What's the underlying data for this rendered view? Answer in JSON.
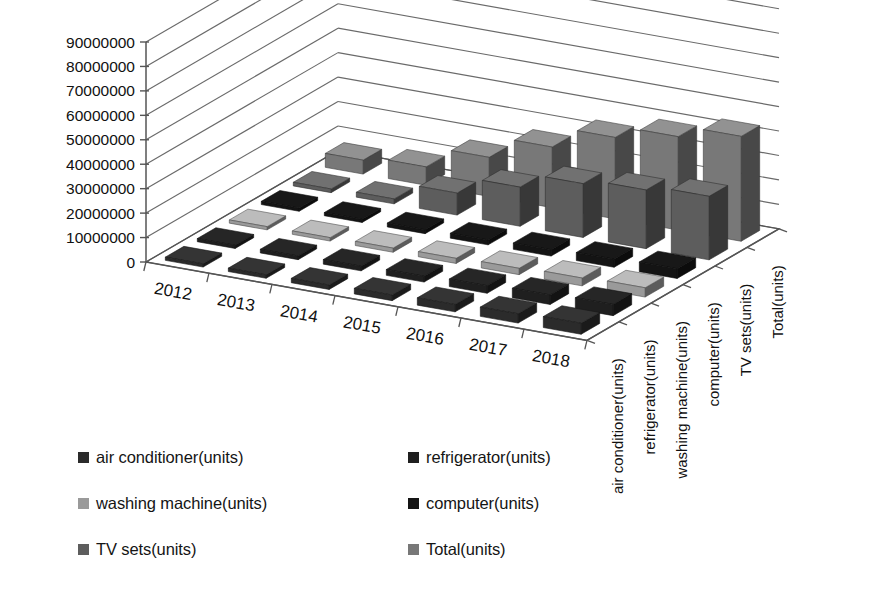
{
  "chart_data": {
    "type": "bar",
    "subtype": "3d-clustered-bar",
    "title": "",
    "xlabel": "",
    "ylabel": "",
    "zlabel": "",
    "grid": true,
    "legend_position": "bottom",
    "ylim": [
      0,
      90000000
    ],
    "yticks": [
      0,
      10000000,
      20000000,
      30000000,
      40000000,
      50000000,
      60000000,
      70000000,
      80000000,
      90000000
    ],
    "ytick_labels": [
      "0",
      "10000000",
      "20000000",
      "30000000",
      "40000000",
      "50000000",
      "60000000",
      "70000000",
      "80000000",
      "90000000"
    ],
    "categories": [
      "2012",
      "2013",
      "2014",
      "2015",
      "2016",
      "2017",
      "2018"
    ],
    "depth_axis_labels": [
      "air conditioner(units)",
      "refrigerator(units)",
      "washing machine(units)",
      "computer(units)",
      "TV sets(units)",
      "Total(units)"
    ],
    "series": [
      {
        "name": "air conditioner(units)",
        "color": "#2b2b2b",
        "values": [
          1000000,
          1400000,
          1800000,
          2300000,
          3000000,
          3800000,
          4500000
        ]
      },
      {
        "name": "refrigerator(units)",
        "color": "#1f1f1f",
        "values": [
          1200000,
          1500000,
          1900000,
          2400000,
          3100000,
          3900000,
          4600000
        ]
      },
      {
        "name": "washing machine(units)",
        "color": "#9a9a9a",
        "values": [
          1100000,
          1400000,
          1700000,
          2100000,
          2600000,
          3200000,
          3800000
        ]
      },
      {
        "name": "computer(units)",
        "color": "#141414",
        "values": [
          900000,
          1200000,
          1600000,
          2000000,
          2600000,
          3300000,
          4000000
        ]
      },
      {
        "name": "TV sets(units)",
        "color": "#5d5d5d",
        "values": [
          1500000,
          2000000,
          9000000,
          16000000,
          22000000,
          24000000,
          26000000
        ]
      },
      {
        "name": "Total(units)",
        "color": "#787878",
        "values": [
          5700000,
          7500000,
          16000000,
          24800000,
          33300000,
          38200000,
          42900000
        ]
      }
    ]
  },
  "legend": {
    "items": [
      {
        "label": "air conditioner(units)",
        "color": "#2b2b2b"
      },
      {
        "label": "refrigerator(units)",
        "color": "#1f1f1f"
      },
      {
        "label": "washing machine(units)",
        "color": "#9a9a9a"
      },
      {
        "label": "computer(units)",
        "color": "#141414"
      },
      {
        "label": "TV sets(units)",
        "color": "#5d5d5d"
      },
      {
        "label": "Total(units)",
        "color": "#787878"
      }
    ]
  },
  "style": {
    "axis_color": "#555555",
    "grid_color": "#6a6a6a",
    "background": "#ffffff",
    "text_color": "#111111"
  }
}
